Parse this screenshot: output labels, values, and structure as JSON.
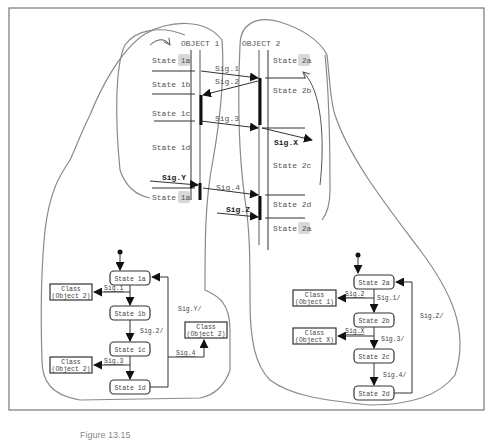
{
  "colors": {
    "outline": "#8a8a8a",
    "line": "#333333",
    "activation_bar": "#111111",
    "state_highlight": "#d8d8d8"
  },
  "sequence": {
    "objects": [
      {
        "label": "OBJECT 1"
      },
      {
        "label": "OBJECT 2"
      }
    ],
    "object1_states": [
      "State 1a",
      "State 1b",
      "State 1c",
      "State 1d",
      "State 1a"
    ],
    "object2_states": [
      "State 2a",
      "State 2b",
      "State 2c",
      "State 2d",
      "State 2a"
    ],
    "signals": {
      "sig1": "Sig.1",
      "sig2": "Sig.2",
      "sig3": "Sig.3",
      "sigX": "Sig.X",
      "sigY": "Sig.Y",
      "sig4": "Sig.4",
      "sigZ": "Sig.Z"
    }
  },
  "statechart1": {
    "states": [
      "State 1a",
      "State 1b",
      "State 1c",
      "State 1d"
    ],
    "classes": [
      {
        "line1": "Class",
        "line2": "(Object 2)"
      },
      {
        "line1": "Class",
        "line2": "(Object 2)"
      },
      {
        "line1": "Class",
        "line2": "(Object 2)"
      }
    ],
    "labels": {
      "send_sig1": "Sig.1",
      "recv_sig2": "Sig.2/",
      "send_sig3": "Sig.3",
      "recv_sigY": "Sig.Y/",
      "send_sig4": "Sig.4"
    }
  },
  "statechart2": {
    "states": [
      "State 2a",
      "State 2b",
      "State 2c",
      "State 2d"
    ],
    "classes": [
      {
        "line1": "Class",
        "line2": "(Object 1)"
      },
      {
        "line1": "Class",
        "line2": "(Object X)"
      }
    ],
    "labels": {
      "send_sig2": "Sig.2",
      "recv_sig1": "Sig.1/",
      "send_sigX": "Sig.X",
      "recv_sig3": "Sig.3/",
      "recv_sig4": "Sig.4/",
      "recv_sigZ": "Sig.Z/"
    }
  },
  "caption": "Figure 13.15"
}
